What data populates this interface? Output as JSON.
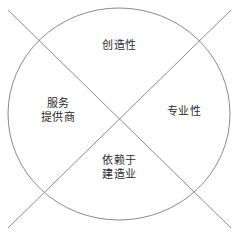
{
  "diagram": {
    "shape": "circle-with-crossed-diagonals",
    "stroke_color": "#8a8a8a",
    "text_color": "#2b2b2b",
    "background_color": "#ffffff",
    "circle": {
      "center_x": 119,
      "center_y": 114,
      "radius_x": 111,
      "radius_y": 106
    },
    "diagonals": [
      {
        "name": "diagonal-top-left-to-bottom-right",
        "x1": 8,
        "y1": 10,
        "x2": 231,
        "y2": 228
      },
      {
        "name": "diagonal-top-right-to-bottom-left",
        "x1": 231,
        "y1": 10,
        "x2": 8,
        "y2": 228
      }
    ],
    "quadrants": {
      "top": {
        "label": "创造性",
        "lines": [
          "创造性"
        ]
      },
      "left": {
        "label": "服务提供商",
        "lines": [
          "服务",
          "提供商"
        ]
      },
      "right": {
        "label": "专业性",
        "lines": [
          "专业性"
        ]
      },
      "bottom": {
        "label": "依赖于建造业",
        "lines": [
          "依赖于",
          "建造业"
        ]
      }
    }
  }
}
